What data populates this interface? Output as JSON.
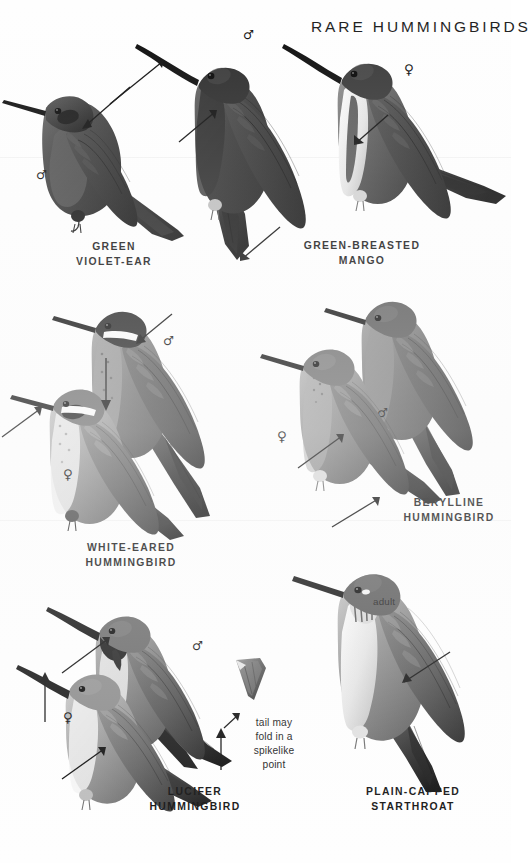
{
  "page": {
    "title": "RARE HUMMINGBIRDS",
    "background_color": "#ffffff",
    "ink_color": "#1a1a1a",
    "width": 511,
    "height": 863
  },
  "symbols": {
    "male": "♂",
    "female": "♀"
  },
  "species": [
    {
      "id": "green-violet-ear",
      "label": "GREEN\nVIOLET-EAR",
      "label_x": 58,
      "label_y": 240,
      "label_width": 112,
      "sexes": [
        {
          "sex": "male",
          "glyph": "♂",
          "x": 36,
          "y": 168
        }
      ]
    },
    {
      "id": "green-breasted-mango",
      "label": "GREEN-BREASTED\nMANGO",
      "label_x": 287,
      "label_y": 239,
      "label_width": 150,
      "sexes": [
        {
          "sex": "male",
          "glyph": "♂",
          "x": 243,
          "y": 28
        },
        {
          "sex": "female",
          "glyph": "♀",
          "x": 404,
          "y": 63
        }
      ]
    },
    {
      "id": "white-eared-hummingbird",
      "label": "WHITE-EARED\nHUMMINGBIRD",
      "label_x": 58,
      "label_y": 541,
      "label_width": 146,
      "sexes": [
        {
          "sex": "male",
          "glyph": "♂",
          "x": 163,
          "y": 334
        },
        {
          "sex": "female",
          "glyph": "♀",
          "x": 63,
          "y": 468
        }
      ]
    },
    {
      "id": "berylline-hummingbird",
      "label": "BERYLLINE\nHUMMINGBIRD",
      "label_x": 391,
      "label_y": 496,
      "label_width": 116,
      "sexes": [
        {
          "sex": "female",
          "glyph": "♀",
          "x": 277,
          "y": 430
        },
        {
          "sex": "male",
          "glyph": "♂",
          "x": 377,
          "y": 406
        }
      ]
    },
    {
      "id": "lucifer-hummingbird",
      "label": "LUCIFER\nHUMMINGBIRD",
      "label_x": 122,
      "label_y": 785,
      "label_width": 146,
      "sexes": [
        {
          "sex": "male",
          "glyph": "♂",
          "x": 192,
          "y": 639
        },
        {
          "sex": "female",
          "glyph": "♀",
          "x": 63,
          "y": 711
        }
      ]
    },
    {
      "id": "plain-capped-starthroat",
      "label": "PLAIN-CAPPED\nSTARTHROAT",
      "label_x": 337,
      "label_y": 785,
      "label_width": 152,
      "ages": [
        {
          "text": "adult",
          "x": 373,
          "y": 596
        }
      ]
    }
  ],
  "annotations": [
    {
      "id": "tail-note",
      "text": "tail may\nfold in a\nspikelike\npoint",
      "x": 238,
      "y": 716,
      "width": 72
    }
  ]
}
